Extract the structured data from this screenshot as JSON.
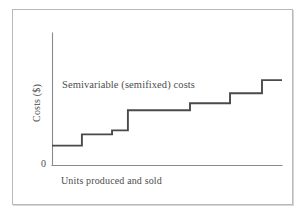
{
  "figure": {
    "frame_border_color": "#b9b9b9",
    "background_color": "#ffffff"
  },
  "chart_data": {
    "type": "line",
    "subtype": "step",
    "title": "Semivariable (semifixed) costs",
    "xlabel": "Units produced and sold",
    "ylabel": "Costs ($)",
    "origin_label": "0",
    "grid": false,
    "legend": null,
    "line_color": "#4a4a4a",
    "axis_color": "#8a8a8a",
    "xlim": [
      0,
      100
    ],
    "ylim": [
      0,
      100
    ],
    "x_tick_labels": [],
    "y_tick_labels": [
      "0"
    ],
    "annotations": [
      {
        "text": "Semivariable (semifixed) costs",
        "x": 9,
        "y": 76
      }
    ],
    "steps": [
      {
        "x_start": 0,
        "x_end": 13.0,
        "y": 15.0
      },
      {
        "x_start": 13.0,
        "x_end": 26.1,
        "y": 23.5
      },
      {
        "x_start": 26.1,
        "x_end": 33.0,
        "y": 26.5
      },
      {
        "x_start": 33.0,
        "x_end": 60.0,
        "y": 41.7
      },
      {
        "x_start": 60.0,
        "x_end": 77.4,
        "y": 47.0
      },
      {
        "x_start": 77.4,
        "x_end": 91.3,
        "y": 54.5
      },
      {
        "x_start": 91.3,
        "x_end": 100.0,
        "y": 64.4
      }
    ],
    "x": [
      0,
      13.0,
      13.0,
      26.1,
      26.1,
      33.0,
      33.0,
      60.0,
      60.0,
      77.4,
      77.4,
      91.3,
      91.3,
      100.0
    ],
    "y": [
      15.0,
      15.0,
      23.5,
      23.5,
      26.5,
      26.5,
      41.7,
      41.7,
      47.0,
      47.0,
      54.5,
      54.5,
      64.4,
      64.4
    ]
  }
}
